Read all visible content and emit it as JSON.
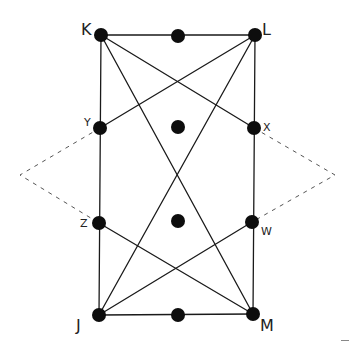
{
  "diagram": {
    "type": "graph",
    "colors": {
      "line": "#1a1a1a",
      "node": "#0d0d0d",
      "dashed": "#555555",
      "background": "#ffffff"
    },
    "nodes": [
      {
        "id": "K",
        "label": "K",
        "x": 101,
        "y": 35,
        "label_x": 81,
        "label_y": 22,
        "size": "big"
      },
      {
        "id": "L",
        "label": "L",
        "x": 255,
        "y": 35,
        "label_x": 262,
        "label_y": 22,
        "size": "big"
      },
      {
        "id": "Y",
        "label": "Y",
        "x": 100,
        "y": 128,
        "label_x": 84,
        "label_y": 117,
        "size": "small"
      },
      {
        "id": "X",
        "label": "X",
        "x": 254,
        "y": 128,
        "label_x": 263,
        "label_y": 122,
        "size": "small"
      },
      {
        "id": "Z",
        "label": "Z",
        "x": 99,
        "y": 223,
        "label_x": 80,
        "label_y": 218,
        "size": "small"
      },
      {
        "id": "W",
        "label": "W",
        "x": 252,
        "y": 222,
        "label_x": 261,
        "label_y": 226,
        "size": "small"
      },
      {
        "id": "J",
        "label": "J",
        "x": 99,
        "y": 315,
        "label_x": 76,
        "label_y": 318,
        "size": "big"
      },
      {
        "id": "M",
        "label": "M",
        "x": 253,
        "y": 314,
        "label_x": 260,
        "label_y": 318,
        "size": "big"
      },
      {
        "id": "T",
        "label": "",
        "x": 178,
        "y": 36
      },
      {
        "id": "C1",
        "label": "",
        "x": 178,
        "y": 127
      },
      {
        "id": "C2",
        "label": "",
        "x": 178,
        "y": 221
      },
      {
        "id": "B",
        "label": "",
        "x": 178,
        "y": 315
      }
    ],
    "edges": [
      [
        "K",
        "L"
      ],
      [
        "J",
        "M"
      ],
      [
        "K",
        "J"
      ],
      [
        "L",
        "M"
      ],
      [
        "K",
        "M"
      ],
      [
        "L",
        "J"
      ],
      [
        "K",
        "X"
      ],
      [
        "L",
        "Y"
      ],
      [
        "J",
        "W"
      ],
      [
        "M",
        "Z"
      ]
    ],
    "dashed_paths": [
      {
        "name": "left-dashed-wedge",
        "points": [
          [
            100,
            128
          ],
          [
            20,
            175
          ],
          [
            99,
            223
          ]
        ]
      },
      {
        "name": "right-dashed-wedge",
        "points": [
          [
            254,
            128
          ],
          [
            335,
            175
          ],
          [
            252,
            222
          ]
        ]
      }
    ]
  }
}
